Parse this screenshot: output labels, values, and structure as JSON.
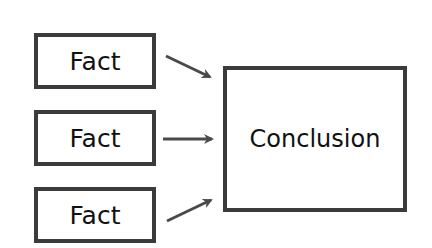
{
  "diagram": {
    "facts": [
      {
        "label": "Fact"
      },
      {
        "label": "Fact"
      },
      {
        "label": "Fact"
      }
    ],
    "conclusion": {
      "label": "Conclusion"
    },
    "colors": {
      "border": "#3b3b3b",
      "text": "#111111",
      "arrow": "#4a4a4a",
      "background": "#ffffff"
    },
    "edges": [
      {
        "from": "fact-1",
        "to": "conclusion"
      },
      {
        "from": "fact-2",
        "to": "conclusion"
      },
      {
        "from": "fact-3",
        "to": "conclusion"
      }
    ]
  }
}
